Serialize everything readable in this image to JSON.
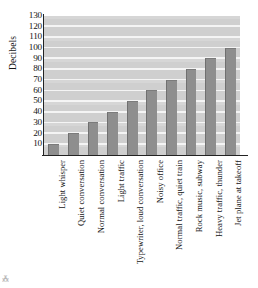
{
  "chart_data": {
    "type": "bar",
    "title": "",
    "subtitle": "",
    "xlabel": "",
    "ylabel": "Decibels",
    "ylim": [
      0,
      130
    ],
    "ytick_step": 10,
    "yticks": [
      130,
      120,
      110,
      100,
      90,
      80,
      70,
      60,
      50,
      40,
      30,
      20,
      10
    ],
    "grid": true,
    "grid_orientation": "horizontal",
    "legend": false,
    "legend_position": "none",
    "categories": [
      "Light whisper",
      "Quiet conversation",
      "Normal conversation",
      "Light traffic",
      "Typewriter, loud conversation",
      "Noisy office",
      "Normal traffic, quiet train",
      "Rock music, subway",
      "Heavy traffic, thunder",
      "Jet plane at takeoff"
    ],
    "values": [
      10,
      20,
      30,
      40,
      50,
      60,
      70,
      80,
      90,
      100
    ],
    "series": [
      {
        "name": "Decibels",
        "values": [
          10,
          20,
          30,
          40,
          50,
          60,
          70,
          80,
          90,
          100
        ]
      }
    ],
    "annotations": []
  },
  "style": {
    "plot_background": "#cfcfcf",
    "gridline_color": "#f4f4f4",
    "bar_fill": "#8e8e8e",
    "bar_edge": "#6f6f6f",
    "axis_color": "#222222",
    "text_color": "#141414",
    "page_background": "#ffffff"
  },
  "artifact": {
    "mark": "⁂"
  }
}
